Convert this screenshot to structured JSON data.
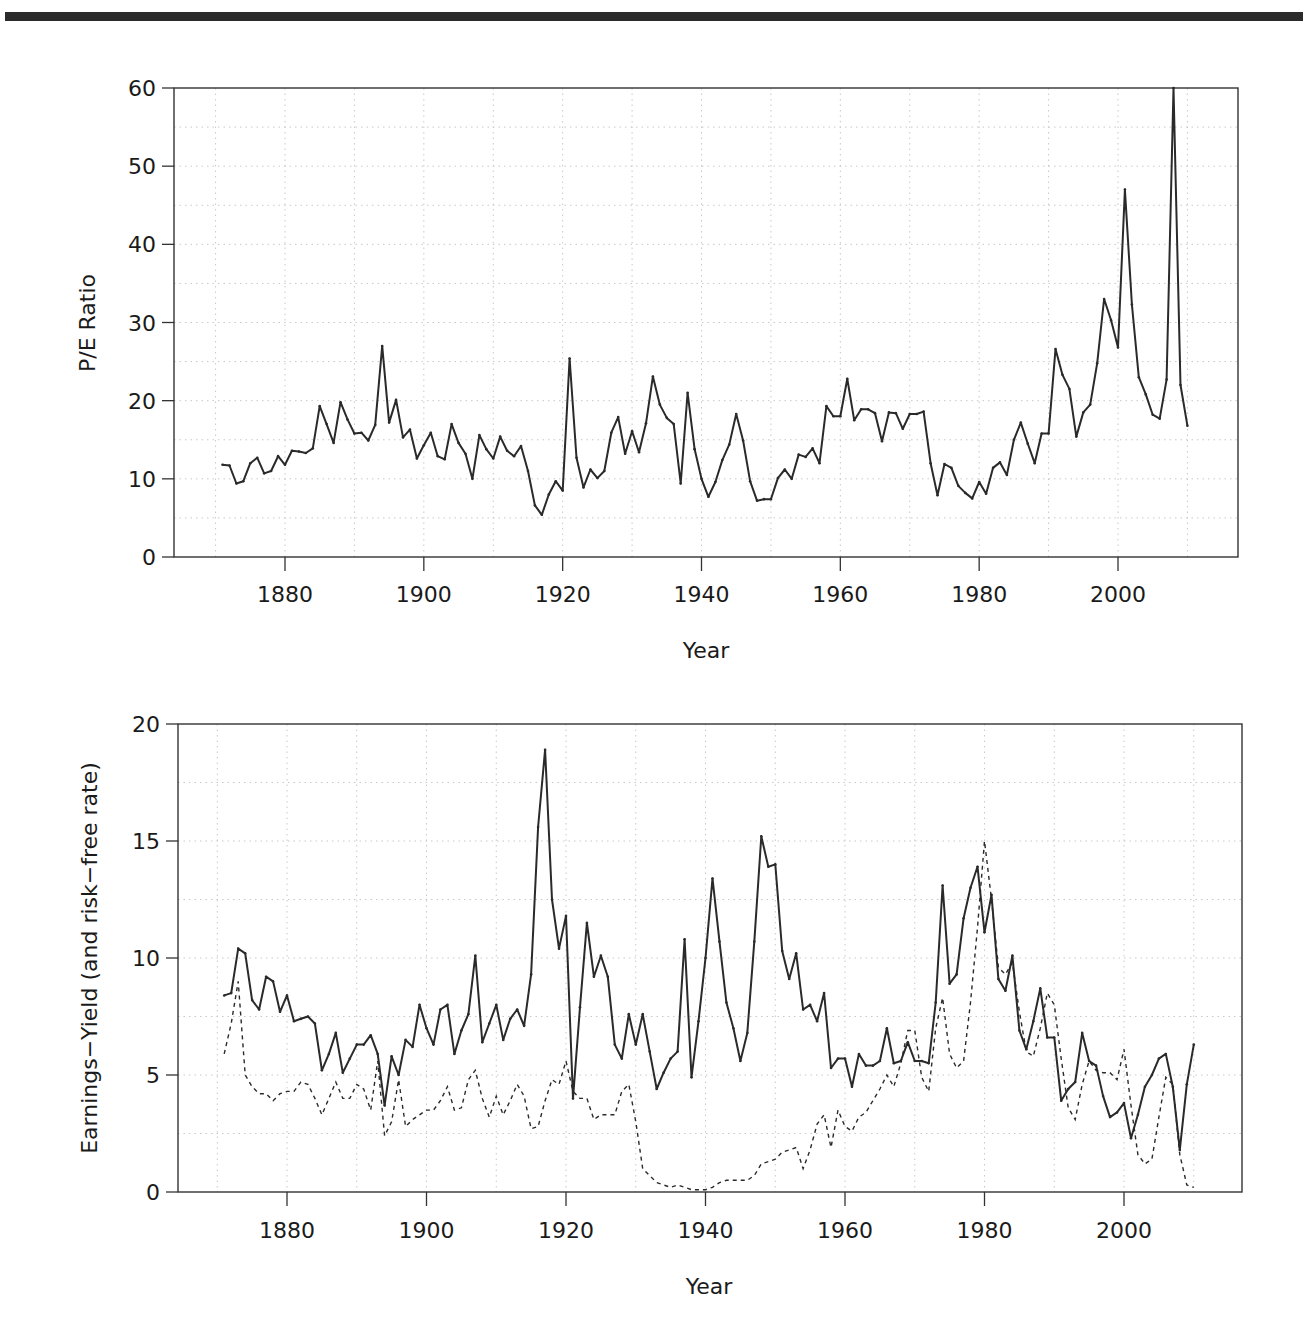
{
  "chart_data": [
    {
      "id": "pe",
      "type": "line",
      "title": "",
      "xlabel": "Year",
      "ylabel": "P/E Ratio",
      "xlim": [
        1863,
        2016
      ],
      "ylim": [
        0,
        60
      ],
      "xticks": [
        1880,
        1900,
        1920,
        1940,
        1960,
        1980,
        2000
      ],
      "yticks": [
        0,
        10,
        20,
        30,
        40,
        50,
        60
      ],
      "grid": true,
      "legend": null,
      "x_start": 1871,
      "series": [
        {
          "name": "P/E Ratio",
          "style": "solid",
          "values": [
            11.8,
            11.7,
            9.4,
            9.7,
            12.0,
            12.7,
            10.7,
            11.0,
            12.9,
            11.8,
            13.6,
            13.5,
            13.3,
            13.9,
            19.3,
            17.0,
            14.6,
            19.8,
            17.6,
            15.8,
            15.9,
            14.9,
            16.9,
            27.0,
            17.2,
            20.1,
            15.3,
            16.3,
            12.6,
            14.3,
            15.9,
            12.9,
            12.5,
            17.0,
            14.6,
            13.2,
            10.0,
            15.6,
            13.8,
            12.6,
            15.4,
            13.6,
            12.9,
            14.2,
            11.0,
            6.6,
            5.4,
            8.0,
            9.7,
            8.5,
            25.4,
            12.7,
            8.9,
            11.2,
            10.1,
            11.0,
            15.9,
            17.9,
            13.2,
            16.1,
            13.4,
            17.1,
            23.1,
            19.5,
            17.8,
            17.0,
            9.4,
            21.0,
            13.8,
            10.0,
            7.7,
            9.6,
            12.4,
            14.4,
            18.3,
            14.9,
            9.7,
            7.2,
            7.4,
            7.4,
            10.1,
            11.2,
            10.0,
            13.1,
            12.8,
            13.9,
            12.0,
            19.3,
            18.0,
            18.0,
            22.8,
            17.5,
            18.9,
            18.9,
            18.4,
            14.8,
            18.5,
            18.4,
            16.4,
            18.3,
            18.3,
            18.6,
            12.0,
            7.9,
            11.9,
            11.4,
            9.1,
            8.2,
            7.5,
            9.6,
            8.1,
            11.4,
            12.1,
            10.5,
            15.0,
            17.2,
            14.5,
            12.0,
            15.8,
            15.8,
            26.6,
            23.3,
            21.5,
            15.4,
            18.5,
            19.5,
            24.8,
            33.0,
            30.3,
            26.8,
            47.0,
            32.3,
            23.0,
            20.8,
            18.2,
            17.7,
            22.7,
            60.0,
            22.0,
            16.8
          ]
        }
      ]
    },
    {
      "id": "ey",
      "type": "line",
      "title": "",
      "xlabel": "Year",
      "ylabel": "Earnings−Yield (and risk−free rate)",
      "xlim": [
        1863,
        2016
      ],
      "ylim": [
        0,
        20
      ],
      "xticks": [
        1880,
        1900,
        1920,
        1940,
        1960,
        1980,
        2000
      ],
      "yticks": [
        0,
        5,
        10,
        15,
        20
      ],
      "grid": true,
      "legend": null,
      "x_start": 1871,
      "series": [
        {
          "name": "Earnings Yield",
          "style": "solid",
          "values": [
            8.4,
            8.5,
            10.4,
            10.2,
            8.2,
            7.8,
            9.2,
            9.0,
            7.7,
            8.4,
            7.3,
            7.4,
            7.5,
            7.2,
            5.2,
            5.9,
            6.8,
            5.1,
            5.7,
            6.3,
            6.3,
            6.7,
            5.9,
            3.7,
            5.8,
            5.0,
            6.5,
            6.2,
            8.0,
            7.0,
            6.3,
            7.8,
            8.0,
            5.9,
            6.9,
            7.6,
            10.1,
            6.4,
            7.2,
            8.0,
            6.5,
            7.4,
            7.8,
            7.1,
            9.3,
            15.6,
            18.9,
            12.5,
            10.4,
            11.8,
            4.0,
            7.9,
            11.5,
            9.2,
            10.1,
            9.2,
            6.3,
            5.7,
            7.6,
            6.3,
            7.6,
            6.0,
            4.4,
            5.1,
            5.7,
            6.0,
            10.8,
            4.9,
            7.3,
            10.0,
            13.4,
            10.7,
            8.1,
            7.0,
            5.6,
            6.8,
            10.7,
            15.2,
            13.9,
            14.0,
            10.3,
            9.1,
            10.2,
            7.8,
            8.0,
            7.3,
            8.5,
            5.3,
            5.7,
            5.7,
            4.5,
            5.9,
            5.4,
            5.4,
            5.6,
            7.0,
            5.5,
            5.6,
            6.4,
            5.6,
            5.6,
            5.5,
            8.1,
            13.1,
            8.9,
            9.3,
            11.7,
            13.0,
            13.9,
            11.1,
            12.7,
            9.1,
            8.6,
            10.1,
            6.9,
            6.1,
            7.3,
            8.7,
            6.6,
            6.6,
            3.9,
            4.4,
            4.7,
            6.8,
            5.6,
            5.4,
            4.1,
            3.2,
            3.4,
            3.8,
            2.3,
            3.3,
            4.5,
            5.0,
            5.7,
            5.9,
            4.5,
            1.8,
            4.6,
            6.3
          ]
        },
        {
          "name": "Risk-free rate",
          "style": "dashed",
          "values": [
            5.9,
            7.2,
            9.0,
            5.0,
            4.5,
            4.2,
            4.2,
            3.9,
            4.2,
            4.3,
            4.3,
            4.7,
            4.6,
            4.0,
            3.3,
            4.0,
            4.7,
            4.0,
            4.0,
            4.6,
            4.4,
            3.5,
            5.6,
            2.4,
            3.0,
            4.8,
            2.8,
            3.1,
            3.3,
            3.5,
            3.5,
            3.9,
            4.5,
            3.5,
            3.6,
            4.8,
            5.2,
            4.0,
            3.2,
            4.1,
            3.3,
            3.9,
            4.6,
            4.1,
            2.7,
            2.8,
            3.9,
            4.8,
            4.6,
            5.6,
            4.3,
            4.0,
            4.0,
            3.1,
            3.3,
            3.3,
            3.3,
            4.3,
            4.6,
            3.0,
            1.0,
            0.7,
            0.4,
            0.3,
            0.2,
            0.3,
            0.2,
            0.1,
            0.1,
            0.1,
            0.2,
            0.4,
            0.5,
            0.5,
            0.5,
            0.5,
            0.7,
            1.2,
            1.3,
            1.4,
            1.7,
            1.8,
            1.9,
            1.0,
            1.8,
            2.9,
            3.3,
            1.9,
            3.5,
            2.8,
            2.6,
            3.2,
            3.4,
            3.9,
            4.4,
            5.0,
            4.5,
            5.5,
            6.9,
            6.9,
            4.9,
            4.3,
            7.0,
            8.3,
            5.9,
            5.3,
            5.6,
            8.1,
            11.3,
            15.0,
            12.5,
            9.6,
            9.3,
            9.8,
            7.7,
            6.0,
            5.8,
            7.0,
            8.5,
            8.0,
            5.7,
            3.6,
            3.1,
            4.6,
            5.6,
            5.2,
            5.1,
            5.1,
            4.8,
            6.1,
            3.7,
            1.6,
            1.2,
            1.4,
            3.2,
            4.9,
            4.6,
            1.6,
            0.3,
            0.2
          ]
        }
      ]
    }
  ],
  "header": {
    "rule": "document top rule"
  },
  "charts": {
    "top": {
      "ylabel": "P/E Ratio",
      "xlabel": "Year",
      "yticks": [
        "0",
        "10",
        "20",
        "30",
        "40",
        "50",
        "60"
      ],
      "xticks": [
        "1880",
        "1900",
        "1920",
        "1940",
        "1960",
        "1980",
        "2000"
      ]
    },
    "bottom": {
      "ylabel": "Earnings−Yield (and risk−free rate)",
      "xlabel": "Year",
      "yticks": [
        "0",
        "5",
        "10",
        "15",
        "20"
      ],
      "xticks": [
        "1880",
        "1900",
        "1920",
        "1940",
        "1960",
        "1980",
        "2000"
      ]
    }
  },
  "colors": {
    "line": "#2a2a2a",
    "frame": "#333333",
    "grid": "#c8c8c8",
    "rule": "#2b2b2b"
  }
}
